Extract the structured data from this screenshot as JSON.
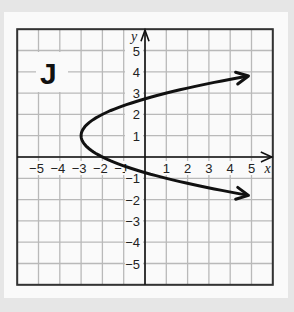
{
  "panel_label": "J",
  "chart_data": {
    "type": "line",
    "title": "",
    "panel_label": "J",
    "xlabel": "x",
    "ylabel": "y",
    "xlim": [
      -6,
      6
    ],
    "ylim": [
      -6,
      6
    ],
    "grid": true,
    "x_ticks": [
      -5,
      -4,
      -3,
      -2,
      -1,
      1,
      2,
      3,
      4,
      5
    ],
    "y_ticks": [
      5,
      4,
      3,
      2,
      1,
      -1,
      -2,
      -3,
      -4,
      -5
    ],
    "x_tick_labels": [
      "−5",
      "−4",
      "−3",
      "−2",
      "−1",
      "1",
      "2",
      "3",
      "4",
      "5"
    ],
    "y_tick_labels": [
      "5",
      "4",
      "3",
      "2",
      "1",
      "−1",
      "−2",
      "−3",
      "−4",
      "−5"
    ],
    "series": [
      {
        "name": "parabola",
        "equation": "x = (y - 1)^2 - 3",
        "vertex": [
          -3,
          1
        ],
        "opens": "right",
        "arrows_at_ends": true,
        "points": [
          [
            5,
            3.83
          ],
          [
            3,
            3.45
          ],
          [
            1,
            3
          ],
          [
            0,
            2.73
          ],
          [
            -1,
            2.41
          ],
          [
            -2,
            2
          ],
          [
            -2.75,
            1.5
          ],
          [
            -3,
            1
          ],
          [
            -2.75,
            0.5
          ],
          [
            -2,
            0
          ],
          [
            -1,
            -0.41
          ],
          [
            0,
            -0.73
          ],
          [
            1,
            -1
          ],
          [
            3,
            -1.45
          ],
          [
            5,
            -1.83
          ]
        ]
      }
    ]
  }
}
